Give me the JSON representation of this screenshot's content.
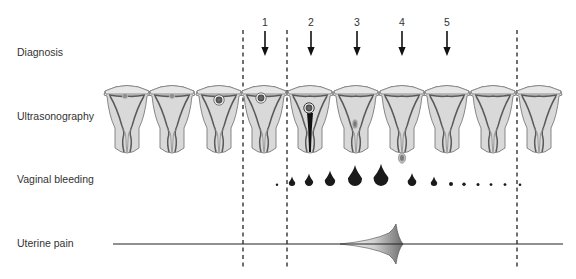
{
  "rows": [
    {
      "label": "Diagnosis",
      "y": 52
    },
    {
      "label": "Ultrasonography",
      "y": 116
    },
    {
      "label": "Vaginal bleeding",
      "y": 179
    },
    {
      "label": "Uterine pain",
      "y": 243
    }
  ],
  "diagnosis_arrows": [
    {
      "label": "1",
      "x": 265
    },
    {
      "label": "2",
      "x": 311
    },
    {
      "label": "3",
      "x": 357
    },
    {
      "label": "4",
      "x": 402
    },
    {
      "label": "5",
      "x": 447
    }
  ],
  "dashed_lines_x": [
    243,
    287,
    517
  ],
  "ultrasonography": [
    {
      "x": 127,
      "content": "small-sac",
      "sac_x": -2,
      "sac_y": 10
    },
    {
      "x": 172,
      "content": "small-sac",
      "sac_x": 0,
      "sac_y": 10
    },
    {
      "x": 219,
      "content": "gestational-sac",
      "sac_x": 0,
      "sac_y": 14
    },
    {
      "x": 264,
      "content": "gestational-sac",
      "sac_x": -3,
      "sac_y": 12
    },
    {
      "x": 310,
      "content": "sac-in-canal",
      "sac_x": -1,
      "sac_y": 22
    },
    {
      "x": 356,
      "content": "remnant-low",
      "sac_x": -1,
      "sac_y": 38
    },
    {
      "x": 402,
      "content": "empty"
    },
    {
      "x": 447,
      "content": "empty"
    },
    {
      "x": 493,
      "content": "empty"
    },
    {
      "x": 539,
      "content": "empty"
    }
  ],
  "bleeding_drops": [
    {
      "x": 277,
      "size": 1.2
    },
    {
      "x": 292,
      "size": 3.2
    },
    {
      "x": 309,
      "size": 4.2
    },
    {
      "x": 330,
      "size": 5.2
    },
    {
      "x": 355,
      "size": 7.0
    },
    {
      "x": 381,
      "size": 7.4
    },
    {
      "x": 412,
      "size": 4.3
    },
    {
      "x": 434,
      "size": 3.2
    },
    {
      "x": 451,
      "size": 2.0
    },
    {
      "x": 464,
      "size": 1.7
    },
    {
      "x": 478,
      "size": 1.5
    },
    {
      "x": 491,
      "size": 1.4
    },
    {
      "x": 505,
      "size": 1.4
    },
    {
      "x": 520,
      "size": 1.3
    }
  ],
  "expelled_sac": {
    "x": 402,
    "y": 158
  },
  "uterine_pain": {
    "line_y": 244,
    "x_start": 113,
    "x_end": 563,
    "peak_x": 397,
    "rise_start_x": 340,
    "peak_height": 20
  },
  "colors": {
    "uterus_fill": "#d9d9d9",
    "uterus_stroke": "#7a7a7a",
    "lining": "#5a5a5a",
    "drop": "#1a1a1a",
    "line": "#222222"
  }
}
